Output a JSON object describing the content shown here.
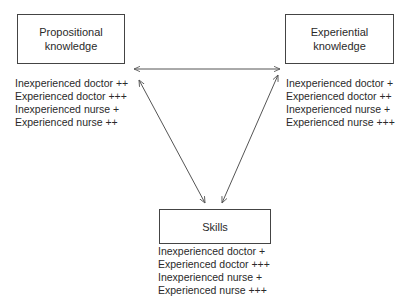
{
  "nodes": {
    "propositional": {
      "title_line1": "Propositional",
      "title_line2": "knowledge",
      "ratings": [
        "Inexperienced doctor ++",
        "Experienced doctor +++",
        "Inexperienced nurse +",
        "Experienced nurse ++"
      ]
    },
    "experiential": {
      "title_line1": "Experiential",
      "title_line2": "knowledge",
      "ratings": [
        "Inexperienced doctor +",
        "Experienced doctor ++",
        "Inexperienced nurse +",
        "Experienced nurse +++"
      ]
    },
    "skills": {
      "title_line1": "Skills",
      "ratings": [
        "Inexperienced doctor +",
        "Experienced doctor +++",
        "Inexperienced nurse +",
        "Experienced nurse +++"
      ]
    }
  },
  "edges": [
    {
      "from": "propositional",
      "to": "experiential",
      "type": "bidirectional"
    },
    {
      "from": "propositional",
      "to": "skills",
      "type": "bidirectional"
    },
    {
      "from": "experiential",
      "to": "skills",
      "type": "bidirectional"
    }
  ],
  "colors": {
    "line": "#555555",
    "text": "#2a2a2a",
    "background": "#ffffff"
  }
}
